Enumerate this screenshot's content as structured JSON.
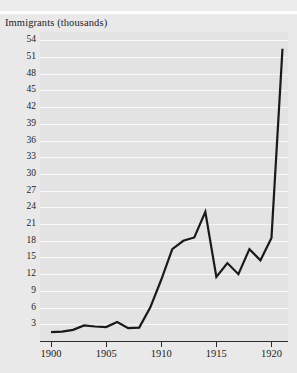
{
  "figure": {
    "background_color": "#e9e9ea",
    "plot_background_color": "#e3e3e4",
    "gridline_color": "#f7f7f8",
    "line_color": "#1a1a1a",
    "axis_color": "#2b2b2b"
  },
  "chart_data": {
    "type": "line",
    "title": "Immigrants (thousands)",
    "xlabel": "",
    "ylabel": "Immigrants (thousands)",
    "xlim": [
      1899,
      1921.5
    ],
    "ylim": [
      0,
      55.5
    ],
    "grid": true,
    "legend": null,
    "ytick_labels": [
      "3",
      "6",
      "9",
      "12",
      "15",
      "18",
      "21",
      "24",
      "27",
      "30",
      "33",
      "36",
      "39",
      "42",
      "45",
      "48",
      "51",
      "54"
    ],
    "ytick_values": [
      3,
      6,
      9,
      12,
      15,
      18,
      21,
      24,
      27,
      30,
      33,
      36,
      39,
      42,
      45,
      48,
      51,
      54
    ],
    "xtick_labels": [
      "1900",
      "1905",
      "1910",
      "1915",
      "1920"
    ],
    "xtick_values": [
      1900,
      1905,
      1910,
      1915,
      1920
    ],
    "x": [
      1900,
      1901,
      1902,
      1903,
      1904,
      1905,
      1906,
      1907,
      1908,
      1909,
      1910,
      1911,
      1912,
      1913,
      1914,
      1915,
      1916,
      1917,
      1918,
      1919,
      1920,
      1921
    ],
    "values": [
      1.6,
      1.7,
      2.0,
      2.8,
      2.6,
      2.5,
      3.4,
      2.3,
      2.4,
      6.0,
      11.0,
      16.5,
      18.0,
      18.6,
      23.2,
      11.5,
      14.0,
      12.0,
      16.5,
      14.5,
      18.5,
      52.5
    ],
    "series": [
      {
        "name": "Immigrants (thousands)",
        "values": [
          1.6,
          1.7,
          2.0,
          2.8,
          2.6,
          2.5,
          3.4,
          2.3,
          2.4,
          6.0,
          11.0,
          16.5,
          18.0,
          18.6,
          23.2,
          11.5,
          14.0,
          12.0,
          16.5,
          14.5,
          18.5,
          52.5
        ]
      }
    ]
  }
}
